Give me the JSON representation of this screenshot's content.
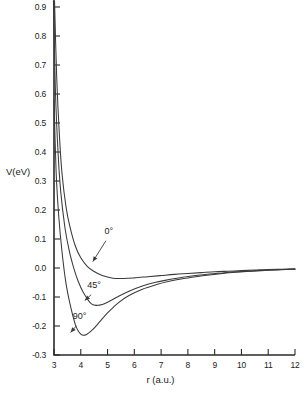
{
  "chart_data": {
    "type": "line",
    "title": "",
    "xlabel": "r (a.u.)",
    "ylabel": "V(eV)",
    "xlim": [
      3,
      12
    ],
    "ylim": [
      -0.3,
      0.95
    ],
    "grid": false,
    "legend": "inline-annotations",
    "xticks": [
      3,
      4,
      5,
      6,
      7,
      8,
      9,
      10,
      11,
      12
    ],
    "xticklabels": [
      "3",
      "4",
      "5",
      "6",
      "7",
      "8",
      "9",
      "10",
      "11",
      "12"
    ],
    "yticks": [
      -0.3,
      -0.2,
      -0.1,
      0.0,
      0.1,
      0.2,
      0.3,
      0.4,
      0.5,
      0.6,
      0.7,
      0.8,
      0.9
    ],
    "yticklabels": [
      "-0.3",
      "-0.2",
      "-0.1",
      "0.0",
      "0.1",
      "0.2",
      "0.3",
      "0.4",
      "0.5",
      "0.6",
      "0.7",
      "0.8",
      "0.9"
    ],
    "series": [
      {
        "name": "0°",
        "label": "0°",
        "minimum": {
          "r": 5.2,
          "V": -0.035
        },
        "x": [
          3.02,
          3.1,
          3.2,
          3.3,
          3.45,
          3.6,
          3.8,
          4.0,
          4.25,
          4.5,
          4.8,
          5.2,
          5.6,
          6.0,
          6.5,
          7.0,
          7.5,
          8.0,
          8.5,
          9.0,
          9.5,
          10.0,
          10.5,
          11.0,
          11.5,
          12.0
        ],
        "y": [
          0.92,
          0.66,
          0.46,
          0.325,
          0.21,
          0.14,
          0.075,
          0.035,
          0.005,
          -0.012,
          -0.026,
          -0.035,
          -0.036,
          -0.034,
          -0.03,
          -0.026,
          -0.022,
          -0.019,
          -0.016,
          -0.013,
          -0.011,
          -0.009,
          -0.007,
          -0.005,
          -0.004,
          -0.003
        ]
      },
      {
        "name": "45°",
        "label": "45°",
        "minimum": {
          "r": 4.4,
          "V": -0.125
        },
        "x": [
          2.98,
          3.05,
          3.15,
          3.25,
          3.4,
          3.55,
          3.7,
          3.9,
          4.1,
          4.4,
          4.7,
          5.0,
          5.4,
          5.8,
          6.3,
          6.8,
          7.3,
          7.8,
          8.3,
          8.8,
          9.3,
          9.8,
          10.4,
          11.0,
          11.5,
          12.0
        ],
        "y": [
          0.92,
          0.62,
          0.4,
          0.265,
          0.145,
          0.068,
          0.012,
          -0.045,
          -0.085,
          -0.124,
          -0.128,
          -0.118,
          -0.098,
          -0.08,
          -0.062,
          -0.049,
          -0.04,
          -0.032,
          -0.026,
          -0.021,
          -0.017,
          -0.013,
          -0.01,
          -0.007,
          -0.005,
          -0.004
        ]
      },
      {
        "name": "90°",
        "label": "90°",
        "minimum": {
          "r": 4.0,
          "V": -0.23
        },
        "x": [
          2.95,
          3.0,
          3.08,
          3.18,
          3.3,
          3.45,
          3.6,
          3.8,
          4.0,
          4.2,
          4.45,
          4.7,
          5.0,
          5.4,
          5.8,
          6.3,
          6.8,
          7.3,
          7.8,
          8.3,
          8.8,
          9.3,
          9.8,
          10.4,
          11.0,
          11.5,
          12.0
        ],
        "y": [
          0.92,
          0.58,
          0.33,
          0.175,
          0.055,
          -0.055,
          -0.125,
          -0.196,
          -0.228,
          -0.23,
          -0.212,
          -0.186,
          -0.155,
          -0.12,
          -0.095,
          -0.073,
          -0.058,
          -0.046,
          -0.037,
          -0.03,
          -0.024,
          -0.019,
          -0.015,
          -0.011,
          -0.008,
          -0.006,
          -0.004
        ]
      }
    ],
    "annotations": [
      {
        "text": "0°",
        "label_r": 5.05,
        "label_V": 0.118,
        "arrow_to_r": 4.45,
        "arrow_to_V": 0.022
      },
      {
        "text": "45°",
        "label_r": 4.5,
        "label_V": -0.068,
        "arrow_to_r": 4.15,
        "arrow_to_V": -0.112
      },
      {
        "text": "90°",
        "label_r": 3.95,
        "label_V": -0.175,
        "arrow_to_r": 3.62,
        "arrow_to_V": -0.222
      }
    ]
  }
}
